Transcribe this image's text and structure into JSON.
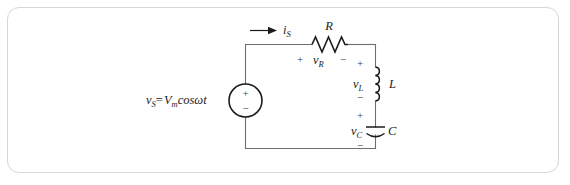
{
  "figure": {
    "kind": "schematic",
    "frame_color": "#d6d6d8",
    "background_color": "#ffffff",
    "wire_color": "#6e6e73",
    "symbol_color": "#1b1b1b"
  },
  "labels": {
    "source_expr_v": "v",
    "source_expr_v_sub": "S",
    "source_expr_eq": "=",
    "source_expr_V": "V",
    "source_expr_V_sub": "m",
    "source_expr_cos": "cos",
    "source_expr_omega": "ω",
    "source_expr_t": "t",
    "source_full": "v_S = V_m cos ωt",
    "current_symbol": "i",
    "current_sub": "S",
    "resistor_name": "R",
    "resistor_voltage": "v",
    "resistor_voltage_sub": "R",
    "inductor_name": "L",
    "inductor_voltage": "v",
    "inductor_voltage_sub": "L",
    "capacitor_name": "C",
    "capacitor_voltage": "v",
    "capacitor_voltage_sub": "C",
    "plus": "+",
    "minus": "−"
  },
  "components": [
    {
      "id": "source",
      "type": "voltage-source",
      "label": "v_S = V_m cos ωt",
      "terminal_top": "+",
      "terminal_bottom": "−"
    },
    {
      "id": "resistor",
      "type": "resistor",
      "label": "R",
      "voltage_label": "v_R",
      "polarity_left": "+",
      "polarity_right": "−"
    },
    {
      "id": "inductor",
      "type": "inductor",
      "label": "L",
      "voltage_label": "v_L",
      "polarity_top": "+",
      "polarity_bottom": "−"
    },
    {
      "id": "capacitor",
      "type": "capacitor",
      "label": "C",
      "voltage_label": "v_C",
      "polarity_top": "+",
      "polarity_bottom": "−"
    }
  ],
  "current": {
    "symbol": "i_S",
    "direction": "right"
  }
}
